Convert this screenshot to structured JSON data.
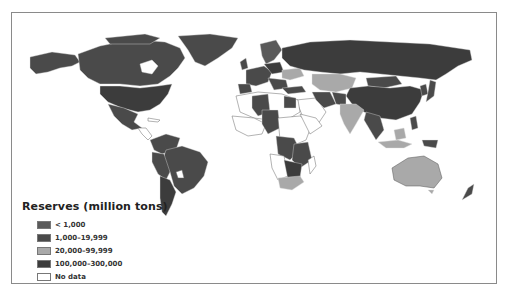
{
  "map": {
    "type": "choropleth-world",
    "subject": "Coal reserves by country"
  },
  "legend": {
    "title": "Reserves (million tons)",
    "items": [
      {
        "label": "< 1,000",
        "color": "#5a5a5a"
      },
      {
        "label": "1,000–19,999",
        "color": "#4a4a4a"
      },
      {
        "label": "20,000–99,999",
        "color": "#a9a9a9"
      },
      {
        "label": "100,000–300,000",
        "color": "#3c3c3c"
      },
      {
        "label": "No data",
        "color": "#ffffff"
      }
    ]
  },
  "colors": {
    "frame": "#8a8a8a",
    "border_lines": "#ffffff",
    "no_data_outline": "#666666"
  }
}
